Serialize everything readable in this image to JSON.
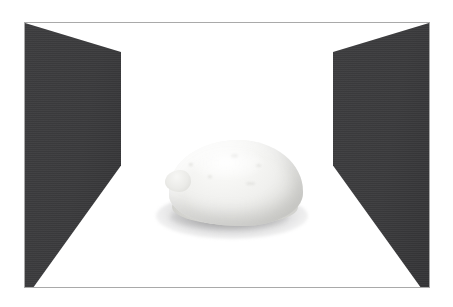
{
  "scene": {
    "title": "Framed still-life photograph",
    "canvas": {
      "width_px": 453,
      "height_px": 307,
      "background_color": "#ffffff"
    },
    "frame": {
      "name": "picture-frame",
      "border_color": "#a9a9a9",
      "border_width_px": 1,
      "left_px": 24,
      "top_px": 22,
      "width_px": 406,
      "height_px": 266,
      "fill_color": "#ffffff"
    },
    "backdrop": {
      "name": "white-studio-backdrop",
      "color": "#ffffff"
    },
    "walls": [
      {
        "id": "wall-left",
        "label": "Left dark wall panel",
        "color": "#3a3a3c",
        "shape": "angled-quadrilateral",
        "side": "left"
      },
      {
        "id": "wall-right",
        "label": "Right dark wall panel",
        "color": "#3a3a3c",
        "shape": "angled-quadrilateral",
        "side": "right"
      }
    ],
    "subject": {
      "id": "object-body",
      "label": "Pale rounded dough-like mass",
      "highlight_color": "#fbfbfa",
      "midtone_color": "#ebebe8",
      "shadow_color": "#cdcdc9",
      "center_x_px": 234,
      "center_y_px": 182,
      "width_px": 134,
      "height_px": 86,
      "features": [
        "rounded dome top",
        "small nub on left flank",
        "faint surface speckles",
        "flattened base"
      ]
    },
    "cast_shadow": {
      "id": "object-shadow",
      "label": "Soft elliptical cast shadow",
      "color": "#8e8e90",
      "opacity": 0.55
    }
  }
}
